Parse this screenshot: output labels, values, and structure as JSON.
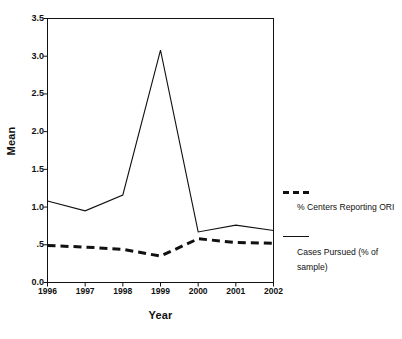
{
  "chart_data": {
    "type": "line",
    "title": "",
    "xlabel": "Year",
    "ylabel": "Mean",
    "categories": [
      "1996",
      "1997",
      "1998",
      "1999",
      "2000",
      "2001",
      "2002"
    ],
    "x": [
      1996,
      1997,
      1998,
      1999,
      2000,
      2001,
      2002
    ],
    "xlim": [
      1996,
      2002
    ],
    "ylim": [
      0.0,
      3.5
    ],
    "yticks": [
      "0.0",
      ".5",
      "1.0",
      "1.5",
      "2.0",
      "2.5",
      "3.0",
      "3.5"
    ],
    "ytick_values": [
      0.0,
      0.5,
      1.0,
      1.5,
      2.0,
      2.5,
      3.0,
      3.5
    ],
    "grid": false,
    "legend_position": "right",
    "series": [
      {
        "name": "Cases Pursued (% of sample)",
        "style": "solid",
        "color": "#111111",
        "values": [
          1.08,
          0.95,
          1.16,
          3.08,
          0.67,
          0.76,
          0.69
        ]
      },
      {
        "name": "% Centers Reporting ORI",
        "style": "dashed",
        "color": "#111111",
        "values": [
          0.49,
          0.47,
          0.44,
          0.35,
          0.58,
          0.53,
          0.52
        ]
      }
    ]
  },
  "axes": {
    "y_title": "Mean",
    "x_title": "Year"
  },
  "legend": {
    "entries": [
      {
        "label": "% Centers Reporting ORI",
        "style": "dashed"
      },
      {
        "label": "Cases Pursued (% of sample)",
        "style": "solid"
      }
    ]
  }
}
